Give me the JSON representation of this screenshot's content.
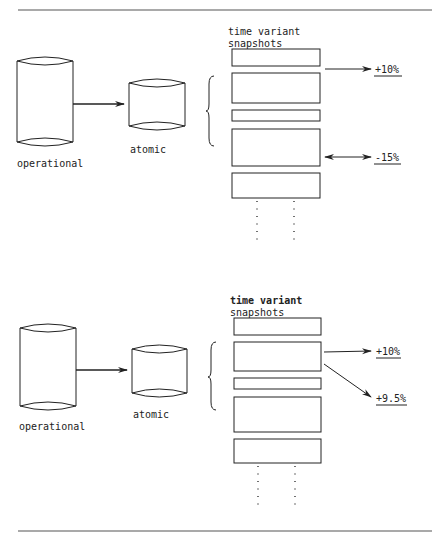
{
  "colors": {
    "ink": "#222222",
    "rule": "#555555",
    "background": "#ffffff"
  },
  "panels": [
    {
      "operational_label": "operational",
      "atomic_label": "atomic",
      "snapshots_title_line1": "time variant",
      "snapshots_title_line2": "snapshots",
      "annotations": [
        {
          "label": "+10%",
          "arrow": "single"
        },
        {
          "label": "-15%",
          "arrow": "double"
        }
      ]
    },
    {
      "operational_label": "operational",
      "atomic_label": "atomic",
      "snapshots_title_line1": "time variant",
      "snapshots_title_line2": "snapshots",
      "annotations": [
        {
          "label": "+10%",
          "arrow": "single"
        },
        {
          "label": "+9.5%",
          "arrow": "single-diagonal"
        }
      ]
    }
  ]
}
